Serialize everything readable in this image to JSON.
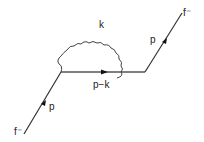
{
  "diagram": {
    "type": "feynman",
    "title": "",
    "colors": {
      "line": "#333333",
      "background": "#ffffff"
    },
    "particles": {
      "incoming": {
        "label": "f⁻",
        "momentum": "p"
      },
      "outgoing": {
        "label": "f⁻",
        "momentum": "p"
      },
      "internal_fermion": {
        "momentum": "p−k"
      },
      "photon": {
        "momentum": "k"
      }
    }
  }
}
